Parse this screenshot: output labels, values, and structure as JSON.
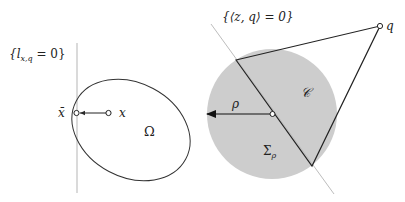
{
  "left_figure": {
    "line_label": "{l",
    "line_label_sub": "x,q",
    "line_label_tail": " = 0}",
    "point_bar_label": "x̄",
    "point_label": "x",
    "region_label": "Ω"
  },
  "right_figure": {
    "line_label": "{⟨z, q⟩ = 0}",
    "apex_label": "q",
    "cone_label": "𝒞",
    "radius_label": "ρ",
    "ball_label": "Σ",
    "ball_label_sub": "ρ"
  },
  "colors": {
    "ball_fill": "#cdcdcd",
    "line_light": "#b8b8b8",
    "stroke": "#2a2a2a"
  }
}
